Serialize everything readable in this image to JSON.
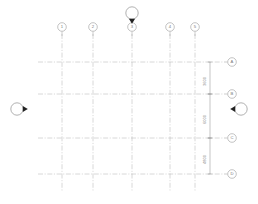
{
  "drawing": {
    "title": "Structural Column Grid Plan",
    "type": "architectural-grid",
    "line_style": "dash-dot",
    "grid_color": "#b9b9b9",
    "bubble_color": "#9a9a9a",
    "dim_color": "#8a8a8a",
    "marker_color": "#222222",
    "background": "#ffffff"
  },
  "column_grid": {
    "axis": "vertical",
    "bubble_position": "top",
    "lines": [
      {
        "label": "1",
        "x": 62,
        "bubble_y": 27
      },
      {
        "label": "2",
        "x": 93,
        "bubble_y": 27
      },
      {
        "label": "3",
        "x": 132,
        "bubble_y": 27
      },
      {
        "label": "4",
        "x": 170,
        "bubble_y": 27
      },
      {
        "label": "5",
        "x": 195,
        "bubble_y": 27
      }
    ],
    "line_top": 34,
    "line_bottom": 192
  },
  "row_grid": {
    "axis": "horizontal",
    "bubble_position": "right",
    "lines": [
      {
        "label": "A",
        "y": 62,
        "bubble_x": 232
      },
      {
        "label": "B",
        "y": 94,
        "bubble_x": 232
      },
      {
        "label": "C",
        "y": 138,
        "bubble_x": 232
      },
      {
        "label": "D",
        "y": 174,
        "bubble_x": 232
      }
    ],
    "line_left": 38,
    "line_right": 224
  },
  "dimension_string": {
    "orientation": "vertical",
    "x": 210,
    "units": "mm",
    "segments": [
      {
        "value": "3600",
        "from": "A",
        "to": "B",
        "y_start": 62,
        "y_end": 94
      },
      {
        "value": "6000",
        "from": "B",
        "to": "C",
        "y_start": 94,
        "y_end": 138
      },
      {
        "value": "4800",
        "from": "C",
        "to": "D",
        "y_start": 138,
        "y_end": 174
      }
    ]
  },
  "section_markers": [
    {
      "name": "section-marker-top",
      "label": "1",
      "x": 132,
      "y": 13,
      "direction": "down"
    },
    {
      "name": "section-marker-left",
      "label": "2",
      "x": 17,
      "y": 109,
      "direction": "right"
    },
    {
      "name": "section-marker-right",
      "label": "3",
      "x": 241,
      "y": 109,
      "direction": "left"
    }
  ]
}
